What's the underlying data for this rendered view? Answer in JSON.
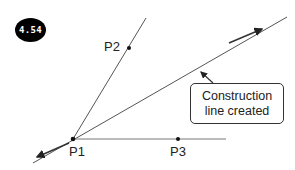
{
  "badge": {
    "label": "4.54"
  },
  "points": {
    "p1": {
      "label": "P1"
    },
    "p2": {
      "label": "P2"
    },
    "p3": {
      "label": "P3"
    }
  },
  "callout": {
    "line1": "Construction",
    "line2": "line created"
  },
  "colors": {
    "line": "#555555",
    "text": "#222222",
    "badge_bg": "#000000",
    "badge_text": "#ffffff"
  }
}
